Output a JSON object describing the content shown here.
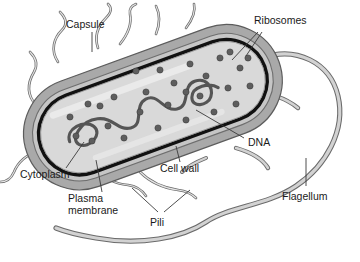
{
  "labels": {
    "capsule": "Capsule",
    "ribosomes": "Ribosomes",
    "dna": "DNA",
    "cytoplasm": "Cytoplasm",
    "plasma_membrane_line1": "Plasma",
    "plasma_membrane_line2": "membrane",
    "cell_wall": "Cell wall",
    "pili": "Pili",
    "flagellum": "Flagellum"
  },
  "colors": {
    "background": "#ffffff",
    "capsule": "#a9a9a9",
    "cell_wall": "#c2c2c2",
    "plasma_membrane": "#111111",
    "cytoplasm": "#d9d9d9",
    "cytoplasm_highlight": "#eeeeee",
    "ribosome": "#5e5e5e",
    "dna": "#555555",
    "pili_fill": "#dcdcdc",
    "pili_stroke": "#6b6b6b",
    "flagellum_fill": "#d2d2d2",
    "flagellum_stroke": "#6b6b6b",
    "text": "#1a1a1a",
    "leader": "#3a3a3a"
  },
  "structures": {
    "ribosome_count": 28,
    "pili_count": 9,
    "flagellum_count": 1,
    "dna_description": "single circular looped chromosome (nucleoid)"
  }
}
